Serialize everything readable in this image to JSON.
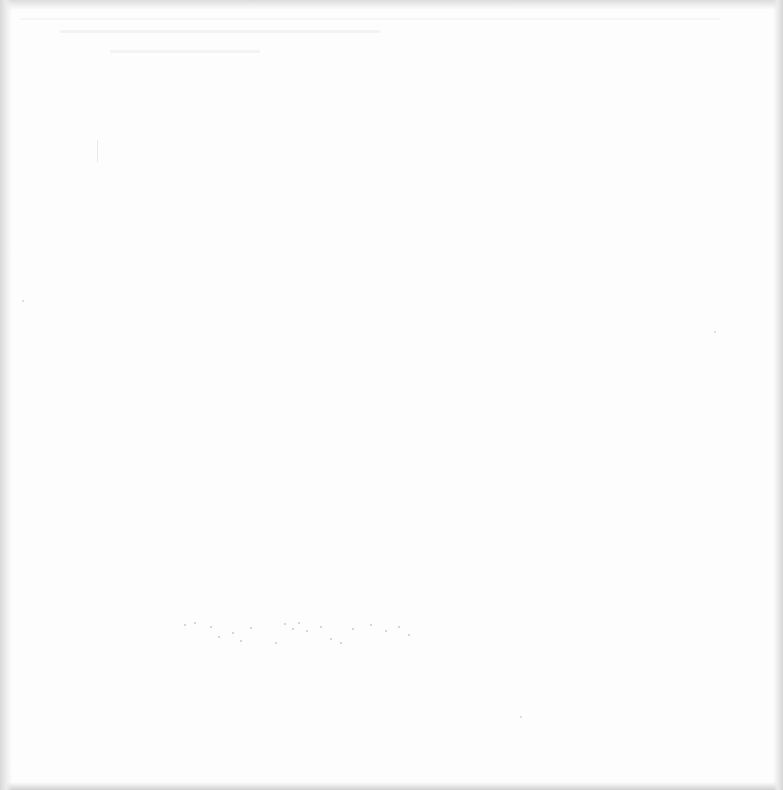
{
  "page": {
    "background_color": "#fdfdfd",
    "edge_shadow_color": "#d8d8d8",
    "text_content": ""
  }
}
